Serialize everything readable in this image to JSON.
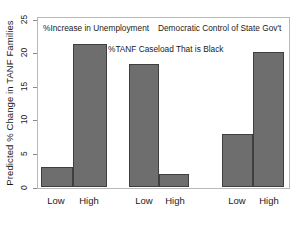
{
  "chart_data": {
    "type": "bar",
    "title": "",
    "xlabel": "",
    "ylabel": "Predicted % Change in TANF Families",
    "ylim": [
      0,
      25
    ],
    "yticks": [
      0,
      5,
      10,
      15,
      20,
      25
    ],
    "ytick_labels": [
      "0",
      "5",
      "10",
      "15",
      "20",
      "25"
    ],
    "grid": false,
    "legend": "none",
    "categories": [
      "Low",
      "High"
    ],
    "groups": [
      {
        "annotation": "%Increase in Unemployment",
        "categories": [
          "Low",
          "High"
        ],
        "values": [
          3.3,
          23.0
        ]
      },
      {
        "annotation": "%TANF Caseload That is Black",
        "categories": [
          "Low",
          "High"
        ],
        "values": [
          19.8,
          2.1
        ]
      },
      {
        "annotation": "Democratic Control of State Gov't",
        "categories": [
          "Low",
          "High"
        ],
        "values": [
          8.5,
          21.8
        ]
      }
    ],
    "bar_color": "#6e6e6e",
    "bar_edge_color": "#3f3f3f",
    "frame_color": "#b9b9b9"
  },
  "axis": {
    "y_label": "Predicted % Change in TANF Families",
    "y_ticks": [
      "25",
      "20",
      "15",
      "10",
      "5",
      "0"
    ]
  },
  "annotations": {
    "unemployment": "%Increase in Unemployment",
    "caseload": "%TANF Caseload That is Black",
    "democratic": "Democratic Control of State Gov't"
  },
  "x_labels": {
    "g1_low": "Low",
    "g1_high": "High",
    "g2_low": "Low",
    "g2_high": "High",
    "g3_low": "Low",
    "g3_high": "High"
  }
}
